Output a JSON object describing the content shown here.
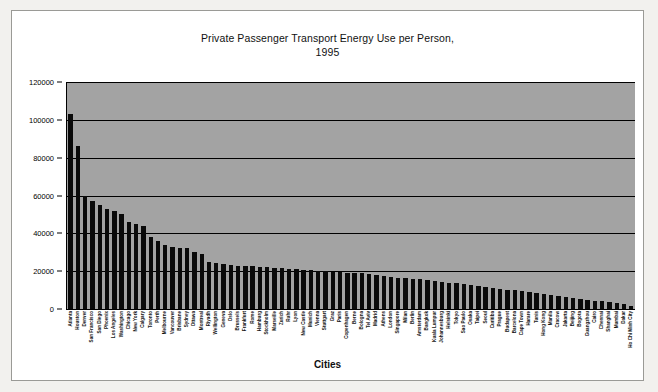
{
  "chart_data": {
    "type": "bar",
    "title": "Private Passenger Transport Energy Use per Person, 1995",
    "title_line1": "Private Passenger Transport Energy Use per Person,",
    "title_line2": "1995",
    "xlabel": "Cities",
    "ylabel": "",
    "ylim": [
      0,
      120000
    ],
    "ytick_values": [
      0,
      20000,
      40000,
      60000,
      80000,
      100000,
      120000
    ],
    "ytick_labels": [
      "0",
      "20000",
      "40000",
      "60000",
      "80000",
      "100000",
      "120000"
    ],
    "grid": true,
    "legend": "none",
    "bar_color": "#0a0a0a",
    "plot_background": "#a3a3a3",
    "categories": [
      "Atlanta",
      "Houston",
      "Denver",
      "San Francisco",
      "San Diego",
      "Phoenix",
      "Los Angeles",
      "Washington",
      "Chicago",
      "New York",
      "Calgary",
      "Toronto",
      "Perth",
      "Melbourne",
      "Vancouver",
      "Brisbane",
      "Sydney",
      "Ottawa",
      "Montreal",
      "Riyadh",
      "Wellington",
      "Geneva",
      "Oslo",
      "Brussels",
      "Frankfurt",
      "Rome",
      "Hamburg",
      "Stockholm",
      "Marseille",
      "Zurich",
      "Ruhr",
      "Lyon",
      "New Castle",
      "Munich",
      "Vienna",
      "Stuttgart",
      "Graz",
      "Paris",
      "Copenhagen",
      "Berne",
      "Bologna",
      "Tel Aviv",
      "Madrid",
      "Athens",
      "London",
      "Singapore",
      "Milan",
      "Berlin",
      "Amsterdam",
      "Bangkok",
      "Kuala Lumpur",
      "Johannesburg",
      "Helsinki",
      "Tokyo",
      "Sao Paulo",
      "Osaka",
      "Taipei",
      "Seoul",
      "Curitiba",
      "Prague",
      "Budapest",
      "Barcelona",
      "Cape Town",
      "Harare",
      "Tunis",
      "Hong Kong",
      "Manila",
      "Cracow",
      "Jakarta",
      "Beijing",
      "Bogota",
      "Guangzhou",
      "Cairo",
      "Chennai",
      "Shanghai",
      "Mumbai",
      "Dakar",
      "Ho Chi Minh City"
    ],
    "values": [
      103000,
      86000,
      60000,
      57000,
      55000,
      53000,
      52000,
      50000,
      46000,
      45000,
      44000,
      38000,
      36000,
      34000,
      33000,
      32500,
      32000,
      30000,
      29000,
      25000,
      24500,
      24000,
      23500,
      23000,
      22800,
      22500,
      22300,
      22000,
      21800,
      21500,
      21200,
      21000,
      20800,
      20500,
      20300,
      20000,
      19800,
      19500,
      19200,
      19000,
      18800,
      18500,
      18000,
      17500,
      17000,
      16500,
      16200,
      16000,
      15800,
      15500,
      15000,
      14500,
      14000,
      13500,
      13000,
      12500,
      12000,
      11500,
      11000,
      10500,
      10000,
      9800,
      9500,
      9000,
      8500,
      8000,
      7500,
      7000,
      6500,
      6000,
      5500,
      5000,
      4500,
      4000,
      3500,
      3000,
      2500,
      1500
    ]
  }
}
